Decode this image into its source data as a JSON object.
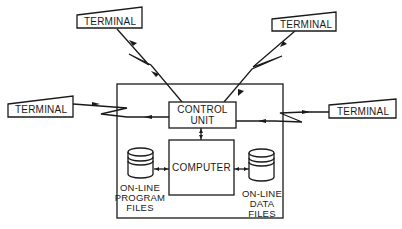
{
  "diagram": {
    "terminals": {
      "top_left": "TERMINAL",
      "top_right": "TERMINAL",
      "left": "TERMINAL",
      "right": "TERMINAL"
    },
    "control_unit": {
      "line1": "CONTROL",
      "line2": "UNIT"
    },
    "computer": "COMPUTER",
    "program_files": {
      "line1": "ON-LINE",
      "line2": "PROGRAM",
      "line3": "FILES"
    },
    "data_files": {
      "line1": "ON-LINE",
      "line2": "DATA",
      "line3": "FILES"
    },
    "colors": {
      "ink": "#1a1a1a",
      "background": "#ffffff"
    }
  }
}
